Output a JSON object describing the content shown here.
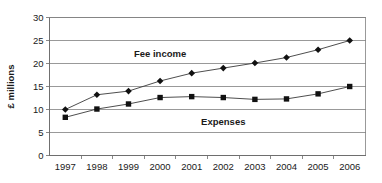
{
  "chart_data": {
    "type": "line",
    "title": "",
    "xlabel": "",
    "ylabel": "£ millions",
    "x": [
      "1997",
      "1998",
      "1999",
      "2000",
      "2001",
      "2002",
      "2003",
      "2004",
      "2005",
      "2006"
    ],
    "categories": [
      "1997",
      "1998",
      "1999",
      "2000",
      "2001",
      "2002",
      "2003",
      "2004",
      "2005",
      "2006"
    ],
    "ylim": [
      0,
      30
    ],
    "yticks": [
      0,
      5,
      10,
      15,
      20,
      25,
      30
    ],
    "ytick_labels": [
      "0",
      "5",
      "10",
      "15",
      "20",
      "25",
      "30"
    ],
    "grid": true,
    "grid_axis": "y",
    "legend": "inline-annotations",
    "series": [
      {
        "name": "Fee income",
        "marker": "diamond",
        "color": "#111111",
        "values": [
          10.0,
          13.2,
          14.0,
          16.2,
          17.9,
          19.0,
          20.1,
          21.3,
          23.0,
          25.0
        ]
      },
      {
        "name": "Expenses",
        "marker": "square",
        "color": "#111111",
        "values": [
          8.3,
          10.1,
          11.2,
          12.6,
          12.8,
          12.6,
          12.2,
          12.3,
          13.4,
          15.0
        ]
      }
    ],
    "annotations": [
      {
        "text": "Fee income",
        "x": "2000",
        "y": 21.5
      },
      {
        "text": "Expenses",
        "x": "2002",
        "y": 6.6
      }
    ]
  },
  "axis": {
    "y_title": "£ millions"
  }
}
